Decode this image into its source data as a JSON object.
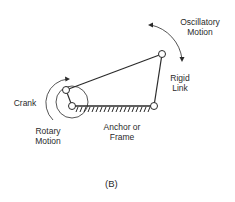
{
  "diagram": {
    "caption": "(B)",
    "labels": {
      "oscillatory_line1": "Oscillatory",
      "oscillatory_line2": "Motion",
      "rigid_line1": "Rigid",
      "rigid_line2": "Link",
      "crank": "Crank",
      "rotary_line1": "Rotary",
      "rotary_line2": "Motion",
      "anchor_line1": "Anchor or",
      "anchor_line2": "Frame"
    },
    "colors": {
      "stroke": "#2a2a2a",
      "background": "#ffffff"
    }
  }
}
